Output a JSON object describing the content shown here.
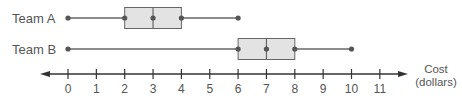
{
  "chart_data": {
    "type": "boxplot",
    "title": "",
    "xlabel": "Cost (dollars)",
    "xlabel_lines": [
      "Cost",
      "(dollars)"
    ],
    "ylabel": "",
    "xlim": [
      0,
      11
    ],
    "x_ticks": [
      0,
      1,
      2,
      3,
      4,
      5,
      6,
      7,
      8,
      9,
      10,
      11
    ],
    "grid": false,
    "legend": null,
    "series": [
      {
        "name": "Team A",
        "min": 0,
        "q1": 2,
        "median": 3,
        "q3": 4,
        "max": 6
      },
      {
        "name": "Team B",
        "min": 0,
        "q1": 6,
        "median": 7,
        "q3": 8,
        "max": 10
      }
    ]
  },
  "colors": {
    "box_fill": "#e3e3e3",
    "line": "#666666",
    "point": "#555555",
    "axis": "#333333",
    "text": "#555555"
  }
}
